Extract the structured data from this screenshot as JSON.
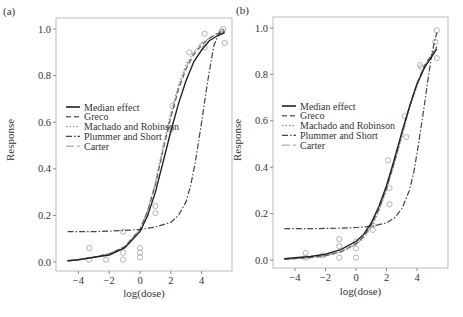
{
  "chart_data": [
    {
      "panel_label": "(a)",
      "type": "line",
      "xlabel": "log(dose)",
      "ylabel": "Response",
      "xticks": [
        -4,
        -2,
        0,
        2,
        4
      ],
      "yticks": [
        "0.0",
        "0.2",
        "0.4",
        "0.6",
        "0.8",
        "1.0"
      ],
      "xlim": [
        -5.2,
        6
      ],
      "ylim": [
        -0.04,
        1.05
      ],
      "grid": false,
      "legend_position": "upper-left (middle)",
      "legend": [
        "Median effect",
        "Greco",
        "Machado and Robinson",
        "Plummer and Short",
        "Carter"
      ],
      "points": [
        [
          -3.3,
          0.06
        ],
        [
          -3.3,
          0.01
        ],
        [
          -2.2,
          0.01
        ],
        [
          -1.1,
          0.01
        ],
        [
          -1.1,
          0.04
        ],
        [
          -1.1,
          0.13
        ],
        [
          0.0,
          0.02
        ],
        [
          0.0,
          0.04
        ],
        [
          0.0,
          0.06
        ],
        [
          1.0,
          0.21
        ],
        [
          1.0,
          0.24
        ],
        [
          2.0,
          0.57
        ],
        [
          2.1,
          0.67
        ],
        [
          3.2,
          0.9
        ],
        [
          4.2,
          0.92
        ],
        [
          4.2,
          0.98
        ],
        [
          5.3,
          0.99
        ],
        [
          5.5,
          0.94
        ],
        [
          5.4,
          1.0
        ]
      ],
      "series": [
        {
          "name": "Median effect",
          "style": "solid",
          "x": [
            -4.7,
            -4,
            -3,
            -2,
            -1,
            0,
            0.5,
            1,
            1.5,
            2,
            2.5,
            3,
            3.5,
            4,
            4.5,
            5,
            5.5
          ],
          "y": [
            0.005,
            0.01,
            0.02,
            0.03,
            0.06,
            0.13,
            0.2,
            0.3,
            0.43,
            0.56,
            0.68,
            0.78,
            0.86,
            0.91,
            0.95,
            0.97,
            0.985
          ]
        },
        {
          "name": "Greco",
          "style": "dashed",
          "x": [
            -4.7,
            -4,
            -3,
            -2,
            -1,
            0,
            0.5,
            1,
            1.5,
            2,
            2.5,
            3,
            3.5,
            4,
            4.5,
            5,
            5.5
          ],
          "y": [
            0.005,
            0.01,
            0.02,
            0.035,
            0.065,
            0.14,
            0.22,
            0.33,
            0.48,
            0.62,
            0.74,
            0.83,
            0.89,
            0.93,
            0.96,
            0.98,
            0.99
          ]
        },
        {
          "name": "Machado and Robinson",
          "style": "dotted",
          "x": [
            -4.7,
            -4,
            -3,
            -2,
            -1,
            0,
            0.5,
            1,
            1.5,
            2,
            2.5,
            3,
            3.5,
            4,
            4.5,
            5,
            5.5
          ],
          "y": [
            0.005,
            0.01,
            0.02,
            0.035,
            0.065,
            0.14,
            0.22,
            0.34,
            0.5,
            0.64,
            0.76,
            0.85,
            0.9,
            0.94,
            0.96,
            0.98,
            0.99
          ]
        },
        {
          "name": "Plummer and Short",
          "style": "dashdot",
          "x": [
            -4.7,
            -3,
            -1,
            0,
            1,
            2,
            2.5,
            3,
            3.3,
            3.6,
            4,
            4.4,
            4.8,
            5.2,
            5.5
          ],
          "y": [
            0.13,
            0.13,
            0.135,
            0.14,
            0.15,
            0.17,
            0.2,
            0.26,
            0.33,
            0.43,
            0.6,
            0.78,
            0.93,
            0.99,
            1.0
          ]
        },
        {
          "name": "Carter",
          "style": "longdash",
          "x": [
            -4.7,
            -4,
            -3,
            -2,
            -1,
            0,
            0.5,
            1,
            1.5,
            2,
            2.5,
            3,
            3.5,
            4,
            4.5,
            5,
            5.5
          ],
          "y": [
            0.005,
            0.01,
            0.02,
            0.035,
            0.065,
            0.14,
            0.22,
            0.34,
            0.49,
            0.63,
            0.75,
            0.84,
            0.9,
            0.94,
            0.96,
            0.98,
            0.99
          ]
        }
      ]
    },
    {
      "panel_label": "(b)",
      "type": "line",
      "xlabel": "log(dose)",
      "ylabel": "Response",
      "xticks": [
        -4,
        -2,
        0,
        2,
        4
      ],
      "yticks": [
        "0.0",
        "0.2",
        "0.4",
        "0.6",
        "0.8",
        "1.0"
      ],
      "xlim": [
        -5.2,
        6
      ],
      "ylim": [
        -0.04,
        1.05
      ],
      "grid": false,
      "legend_position": "upper-left (middle)",
      "legend": [
        "Median effect",
        "Greco",
        "Machado and Robinson",
        "Plummer and Short",
        "Carter"
      ],
      "points": [
        [
          -3.3,
          0.03
        ],
        [
          -3.3,
          0.01
        ],
        [
          -2.2,
          0.02
        ],
        [
          -1.1,
          0.09
        ],
        [
          -1.1,
          0.06
        ],
        [
          -1.1,
          0.01
        ],
        [
          0.0,
          0.08
        ],
        [
          0.0,
          0.05
        ],
        [
          0.0,
          0.01
        ],
        [
          1.1,
          0.15
        ],
        [
          1.1,
          0.13
        ],
        [
          2.1,
          0.43
        ],
        [
          2.2,
          0.31
        ],
        [
          2.2,
          0.24
        ],
        [
          3.2,
          0.62
        ],
        [
          3.3,
          0.53
        ],
        [
          4.2,
          0.84
        ],
        [
          4.3,
          0.83
        ],
        [
          5.3,
          0.99
        ],
        [
          5.2,
          0.94
        ],
        [
          5.3,
          0.87
        ]
      ],
      "series": [
        {
          "name": "Median effect",
          "style": "solid",
          "x": [
            -4.7,
            -4,
            -3,
            -2,
            -1,
            0,
            0.5,
            1,
            1.5,
            2,
            2.5,
            3,
            3.5,
            4,
            4.5,
            5,
            5.3
          ],
          "y": [
            0.005,
            0.01,
            0.015,
            0.025,
            0.045,
            0.08,
            0.11,
            0.16,
            0.23,
            0.32,
            0.43,
            0.55,
            0.66,
            0.76,
            0.83,
            0.88,
            0.91
          ]
        },
        {
          "name": "Greco",
          "style": "dashed",
          "x": [
            -4.7,
            -4,
            -3,
            -2,
            -1,
            0,
            0.5,
            1,
            1.5,
            2,
            2.5,
            3,
            3.5,
            4,
            4.5,
            5,
            5.3
          ],
          "y": [
            0.003,
            0.006,
            0.01,
            0.018,
            0.035,
            0.07,
            0.1,
            0.15,
            0.22,
            0.31,
            0.42,
            0.54,
            0.66,
            0.76,
            0.84,
            0.89,
            0.92
          ]
        },
        {
          "name": "Machado and Robinson",
          "style": "dotted",
          "x": [
            -4.7,
            -4,
            -3,
            -2,
            -1,
            0,
            0.5,
            1,
            1.5,
            2,
            2.5,
            3,
            3.5,
            4,
            4.5,
            5,
            5.3
          ],
          "y": [
            0.003,
            0.006,
            0.01,
            0.018,
            0.035,
            0.065,
            0.095,
            0.14,
            0.21,
            0.3,
            0.41,
            0.53,
            0.65,
            0.75,
            0.83,
            0.89,
            0.92
          ]
        },
        {
          "name": "Plummer and Short",
          "style": "dashdot",
          "x": [
            -4.7,
            -3,
            -1,
            0,
            1,
            2,
            2.5,
            3,
            3.5,
            3.8,
            4.1,
            4.4,
            4.7,
            5,
            5.3
          ],
          "y": [
            0.135,
            0.135,
            0.137,
            0.14,
            0.145,
            0.16,
            0.18,
            0.22,
            0.3,
            0.38,
            0.5,
            0.63,
            0.77,
            0.9,
            0.98
          ]
        },
        {
          "name": "Carter",
          "style": "longdash",
          "x": [
            -4.7,
            -4,
            -3,
            -2,
            -1,
            0,
            0.5,
            1,
            1.5,
            2,
            2.5,
            3,
            3.5,
            4,
            4.5,
            5,
            5.3
          ],
          "y": [
            0.003,
            0.006,
            0.01,
            0.018,
            0.035,
            0.068,
            0.098,
            0.145,
            0.215,
            0.305,
            0.415,
            0.535,
            0.655,
            0.755,
            0.835,
            0.89,
            0.92
          ]
        }
      ]
    }
  ]
}
